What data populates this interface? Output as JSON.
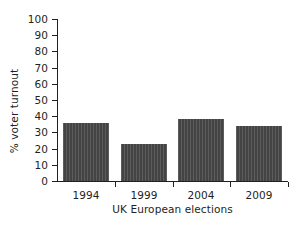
{
  "chart_data": {
    "type": "bar",
    "title": "",
    "xlabel": "UK European elections",
    "ylabel": "% voter turnout",
    "categories": [
      "1994",
      "1999",
      "2004",
      "2009"
    ],
    "values": [
      36,
      23,
      38,
      34
    ],
    "ylim": [
      0,
      100
    ],
    "yticks": [
      "0",
      "10",
      "20",
      "30",
      "40",
      "50",
      "60",
      "70",
      "80",
      "90",
      "100"
    ],
    "ytick_values": [
      0,
      10,
      20,
      30,
      40,
      50,
      60,
      70,
      80,
      90,
      100
    ],
    "grid": false,
    "legend": false,
    "bar_color": "#4b4b4b",
    "axis_color": "#231f20",
    "background_color": "#ffffff"
  }
}
